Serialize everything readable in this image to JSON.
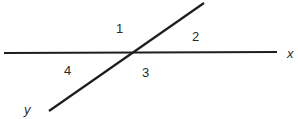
{
  "diagram": {
    "line_color": "#1e1e1e",
    "text_color": "#2a2a2a",
    "lines": {
      "x": {
        "label": "x",
        "x1": 4,
        "y1": 53,
        "x2": 277,
        "y2": 52
      },
      "y": {
        "label": "y",
        "x1": 49,
        "y1": 111,
        "x2": 204,
        "y2": 3
      }
    },
    "angles": [
      {
        "label": "1",
        "x": 116,
        "y": 33
      },
      {
        "label": "2",
        "x": 192,
        "y": 41
      },
      {
        "label": "3",
        "x": 142,
        "y": 77
      },
      {
        "label": "4",
        "x": 64,
        "y": 75
      }
    ]
  }
}
